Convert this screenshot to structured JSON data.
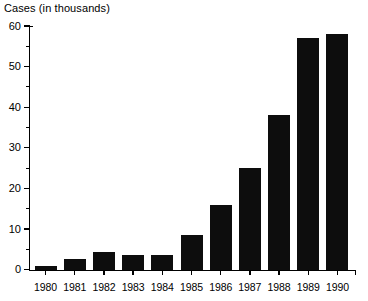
{
  "chart_data": {
    "type": "bar",
    "title": "",
    "xlabel": "",
    "ylabel": "Cases (in thousands)",
    "categories": [
      "1980",
      "1981",
      "1982",
      "1983",
      "1984",
      "1985",
      "1986",
      "1987",
      "1988",
      "1989",
      "1990"
    ],
    "values": [
      1,
      2.5,
      4.3,
      3.5,
      3.7,
      8.5,
      16,
      25,
      38,
      57,
      58
    ],
    "ylim": [
      0,
      60
    ],
    "y_major_ticks": [
      0,
      10,
      20,
      30,
      40,
      50,
      60
    ],
    "y_minor_ticks": [
      5,
      15,
      25,
      35,
      45,
      55
    ],
    "y_tick_labels": [
      "0",
      "10",
      "20",
      "30",
      "40",
      "50",
      "60"
    ],
    "grid": false,
    "legend": false,
    "bar_color": "#0d0d0d",
    "axis_color": "#000000"
  },
  "colors": {
    "background": "#ffffff",
    "bar": "#0d0d0d",
    "axis": "#000000",
    "text": "#000000"
  }
}
